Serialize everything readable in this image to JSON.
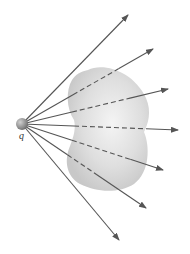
{
  "diagram": {
    "charge": {
      "label": "q",
      "position": [
        22,
        124
      ],
      "radius": 6,
      "color": "#8c8c8c"
    },
    "surface": {
      "fill": "#d9d9d9",
      "path": "M 88 70 C 104 62, 134 72, 146 98 C 152 112, 148 124, 144 132 C 150 146, 150 172, 134 184 C 118 194, 96 192, 80 184 C 66 176, 64 160, 70 146 C 74 136, 76 128, 74 120 C 66 108, 66 90, 72 80 C 76 74, 80 72, 88 70 Z"
    },
    "field_lines": {
      "color": "#555555",
      "lines": [
        {
          "end": [
            128,
            15
          ],
          "dashed_from": null,
          "dashed_to": null
        },
        {
          "end": [
            153,
            49
          ],
          "dashed_from": [
            72,
            93
          ],
          "dashed_to": [
            118,
            68
          ]
        },
        {
          "end": [
            168,
            89
          ],
          "dashed_from": [
            72,
            112
          ],
          "dashed_to": [
            130,
            98
          ]
        },
        {
          "end": [
            178,
            130
          ],
          "dashed_from": [
            74,
            126
          ],
          "dashed_to": [
            146,
            129
          ]
        },
        {
          "end": [
            163,
            170
          ],
          "dashed_from": [
            72,
            140
          ],
          "dashed_to": [
            130,
            160
          ]
        },
        {
          "end": [
            146,
            208
          ],
          "dashed_from": [
            68,
            154
          ],
          "dashed_to": [
            96,
            176
          ]
        },
        {
          "end": [
            119,
            240
          ],
          "dashed_from": null,
          "dashed_to": null
        }
      ]
    }
  }
}
